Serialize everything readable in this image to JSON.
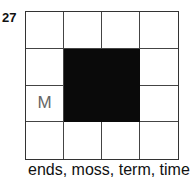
{
  "puzzle": {
    "number": "27",
    "rows": 4,
    "cols": 4,
    "grid": [
      [
        "",
        "",
        "",
        ""
      ],
      [
        "",
        "#",
        "#",
        ""
      ],
      [
        "M",
        "#",
        "#",
        ""
      ],
      [
        "",
        "",
        "",
        ""
      ]
    ],
    "words": "ends, moss, term, time"
  }
}
